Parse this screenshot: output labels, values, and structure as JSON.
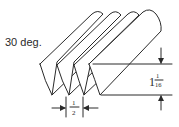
{
  "diagram": {
    "angle_label": "30 deg.",
    "blade_count": 4,
    "spacing_dimension": {
      "whole": "",
      "numerator": "1",
      "denominator": "2"
    },
    "depth_dimension": {
      "whole": "1",
      "numerator": "1",
      "denominator": "16"
    },
    "line_color": "#2a2a2a",
    "background": "#ffffff"
  }
}
